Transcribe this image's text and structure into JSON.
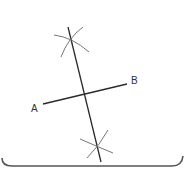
{
  "diagram": {
    "points": {
      "A": {
        "label": "A"
      },
      "B": {
        "label": "B"
      }
    },
    "colors": {
      "line": "#2a2a2a",
      "arc": "#777777",
      "border": "#555555"
    }
  }
}
